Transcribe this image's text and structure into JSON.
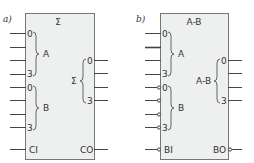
{
  "diagram_a": {
    "label": "a)",
    "title": "Σ",
    "input_group_a": {
      "name": "A",
      "first": "0",
      "last": "3"
    },
    "input_group_b": {
      "name": "B",
      "first": "0",
      "last": "3"
    },
    "output_group": {
      "name": "Σ",
      "first": "0",
      "last": "3"
    },
    "carry_in": "CI",
    "carry_out": "CO"
  },
  "diagram_b": {
    "label": "b)",
    "title": "A-B",
    "input_group_a": {
      "name": "A",
      "first": "0",
      "last": "3"
    },
    "input_group_b": {
      "name": "B",
      "first": "0",
      "last": "3",
      "inverted": true
    },
    "output_group": {
      "name": "A-B",
      "first": "0",
      "last": "3"
    },
    "borrow_in": "BI",
    "borrow_out": "BO"
  }
}
